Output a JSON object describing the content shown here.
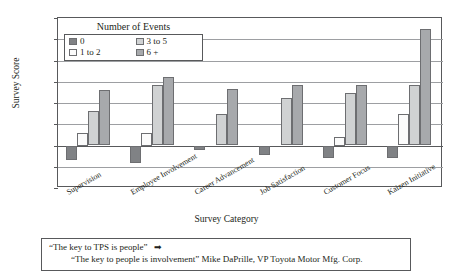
{
  "chart_data": {
    "type": "bar",
    "title": "",
    "xlabel": "Survey Category",
    "ylabel": "Survey Score",
    "ylim": [
      -10,
      30
    ],
    "yticks": [
      30,
      25,
      20,
      15,
      10,
      5,
      0,
      -5,
      -10
    ],
    "ytick_labels": [
      "30",
      "25",
      "20",
      "15",
      "10",
      "5",
      "0",
      "−5",
      "−10"
    ],
    "grid": true,
    "legend_title": "Number of Events",
    "legend_position": "upper-left-inside",
    "categories": [
      "Supervision",
      "Employee Involvement",
      "Career Advancement",
      "Job Satisfaction",
      "Customer Focus",
      "Kaizen Initiative"
    ],
    "series": [
      {
        "name": "0",
        "color": "#808285",
        "values": [
          -3.5,
          -4.0,
          -1.0,
          -2.2,
          -3.0,
          -3.0
        ]
      },
      {
        "name": "1 to 2",
        "color": "#fbfbfb",
        "values": [
          3.0,
          3.0,
          null,
          null,
          2.0,
          7.3
        ]
      },
      {
        "name": "3 to 5",
        "color": "#d0d2d3",
        "values": [
          8.1,
          14.3,
          7.3,
          11.2,
          12.3,
          14.3
        ]
      },
      {
        "name": "6 +",
        "color": "#a7a9ac",
        "values": [
          13.1,
          16.1,
          13.3,
          14.3,
          14.3,
          27.3
        ]
      }
    ]
  },
  "caption": {
    "line1": "“The key to TPS is people”",
    "arrow": "➡",
    "line2": "“The key to people is involvement”  Mike DaPrille, VP Toyota Motor Mfg. Corp."
  }
}
